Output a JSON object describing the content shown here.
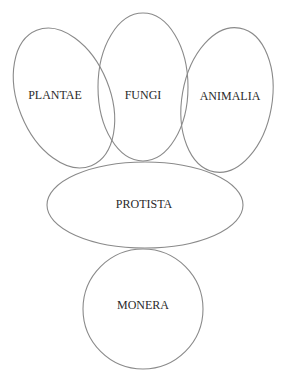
{
  "diagram": {
    "type": "overlapping-ellipses",
    "colors": {
      "stroke": "#8a8a8a",
      "text": "#2a2a2a",
      "background": "#ffffff"
    },
    "nodes": [
      {
        "id": "plantae",
        "label": "PLANTAE"
      },
      {
        "id": "fungi",
        "label": "FUNGI"
      },
      {
        "id": "animalia",
        "label": "ANIMALIA"
      },
      {
        "id": "protista",
        "label": "PROTISTA"
      },
      {
        "id": "monera",
        "label": "MONERA"
      }
    ]
  }
}
